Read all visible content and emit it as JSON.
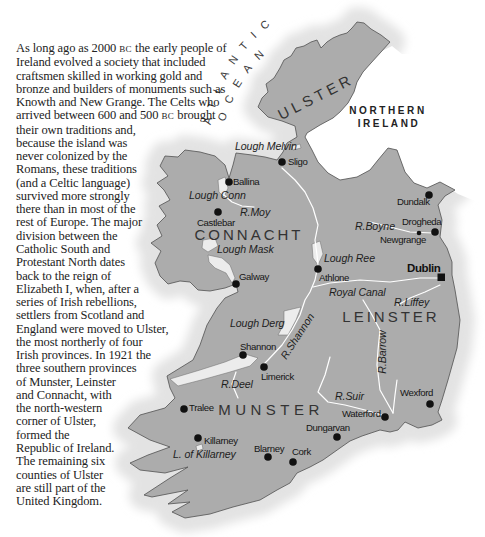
{
  "intro": {
    "lines": [
      {
        "before": "As long ago as 2000 ",
        "sc": "BC",
        "after": " the early people of"
      },
      "Ireland evolved a society that included",
      "craftsmen skilled in working gold and",
      "bronze and builders of monuments such as",
      "Knowth and New Grange. The Celts who",
      {
        "before": "arrived between 600 and 500 ",
        "sc": "BC",
        "after": " brought"
      },
      "their own traditions and,",
      "because the island was",
      "never colonized by the",
      "Romans, these traditions",
      "(and a Celtic language)",
      "survived more strongly",
      "there than in most of the",
      "rest of Europe. The major",
      "division between the",
      "Catholic South and",
      "Protestant North dates",
      "back to the reign of",
      "Elizabeth I, when, after a",
      "series of Irish rebellions,",
      "settlers from Scotland and",
      "England were moved to Ulster,",
      "the most northerly of four",
      "Irish provinces. In 1921 the",
      "three southern provinces",
      "of Munster, Leinster",
      "and Connacht, with",
      "the north-western",
      "corner of Ulster,",
      "formed the",
      "Republic of Ireland.",
      "The remaining six",
      "counties of Ulster",
      "are still part of the",
      "United Kingdom."
    ]
  },
  "map": {
    "ocean_label": {
      "line1": "ATLANTIC",
      "line2": "OCEAN"
    },
    "country_label": {
      "line1": "NORTHERN",
      "line2": "IRELAND"
    },
    "provinces": [
      {
        "name": "ULSTER"
      },
      {
        "name": "CONNACHT"
      },
      {
        "name": "LEINSTER"
      },
      {
        "name": "MUNSTER"
      }
    ],
    "capital": {
      "name": "Dublin",
      "marker": "square"
    },
    "cities": [
      {
        "name": "Sligo"
      },
      {
        "name": "Ballina"
      },
      {
        "name": "Castlebar"
      },
      {
        "name": "Galway"
      },
      {
        "name": "Athlone"
      },
      {
        "name": "Dundalk"
      },
      {
        "name": "Drogheda"
      },
      {
        "name": "Newgrange"
      },
      {
        "name": "Shannon"
      },
      {
        "name": "Limerick"
      },
      {
        "name": "Wexford"
      },
      {
        "name": "Waterford"
      },
      {
        "name": "Dungarvan"
      },
      {
        "name": "Cork"
      },
      {
        "name": "Blarney"
      },
      {
        "name": "Killarney"
      },
      {
        "name": "Tralee"
      }
    ],
    "water_features": [
      {
        "name": "Lough Melvin"
      },
      {
        "name": "Lough Conn"
      },
      {
        "name": "R.Moy"
      },
      {
        "name": "Lough Mask"
      },
      {
        "name": "Lough Ree"
      },
      {
        "name": "R.Boyne"
      },
      {
        "name": "Royal Canal"
      },
      {
        "name": "R.Liffey"
      },
      {
        "name": "Lough Derg"
      },
      {
        "name": "R.Shannon"
      },
      {
        "name": "R.Barrow"
      },
      {
        "name": "R.Deel"
      },
      {
        "name": "R.Suir"
      },
      {
        "name": "L. of Killarney"
      }
    ],
    "colors": {
      "land": "#acacac",
      "coast_halo": "#e3e3e3",
      "sea": "#ffffff",
      "outline": "#505050",
      "rivers": "#ffffff",
      "markers": "#111111"
    }
  }
}
